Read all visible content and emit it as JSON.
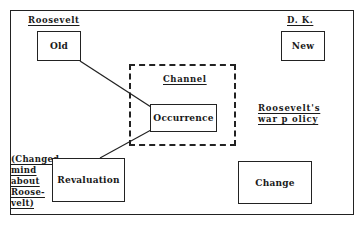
{
  "diagram": {
    "labels": {
      "roosevelt": "Roosevelt",
      "dk": "D. K.",
      "channel": "Channel",
      "war_policy_line1": "Roosevelt's",
      "war_policy_line2": "war p olicy"
    },
    "side_note": [
      "(Changed",
      "mind",
      "about",
      "Roose-",
      "velt)"
    ],
    "boxes": {
      "old": "Old",
      "new": "New",
      "occurrence": "Occurrence",
      "revaluation": "Revaluation",
      "change": "Change"
    },
    "connections": [
      {
        "from": "Old",
        "to": "Occurrence"
      },
      {
        "from": "Occurrence",
        "to": "Revaluation"
      }
    ],
    "colors": {
      "stroke": "#222222",
      "background": "#ffffff"
    }
  }
}
